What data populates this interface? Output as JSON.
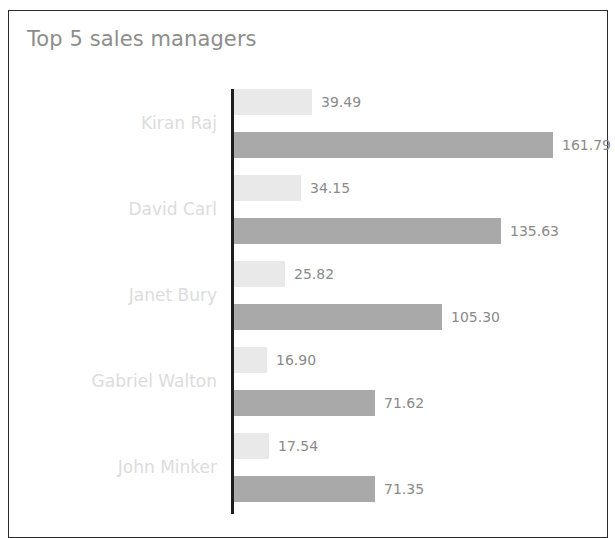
{
  "panel": {
    "title": "Top 5 sales managers"
  },
  "chart_data": {
    "type": "bar",
    "orientation": "horizontal",
    "title": "Top 5 sales managers",
    "xlabel": "",
    "ylabel": "",
    "grid": false,
    "legend": "none",
    "axis_visible": "category-axis-only",
    "categories": [
      "Kiran Raj",
      "David Carl",
      "Janet Bury",
      "Gabriel Walton",
      "John Minker"
    ],
    "series": [
      {
        "name": "series-1",
        "color": "#e9e9e9",
        "values": [
          39.49,
          34.15,
          25.82,
          16.9,
          17.54
        ],
        "labels": [
          "39.49",
          "34.15",
          "25.82",
          "16.90",
          "17.54"
        ]
      },
      {
        "name": "series-2",
        "color": "#a9a9a9",
        "values": [
          161.79,
          135.63,
          105.3,
          71.62,
          71.35
        ],
        "labels": [
          "161.79",
          "135.63",
          "105.30",
          "71.62",
          "71.35"
        ]
      }
    ],
    "xlim": [
      0,
      170
    ],
    "value_label_position": "outside-end"
  },
  "style": {
    "title_color": "#8d8d8d",
    "category_label_color": "#dcdcdc",
    "value_label_color": "#8a8a8a",
    "axis_color": "#1e1e1e",
    "border_color": "#2b2b2b",
    "background": "#ffffff"
  }
}
